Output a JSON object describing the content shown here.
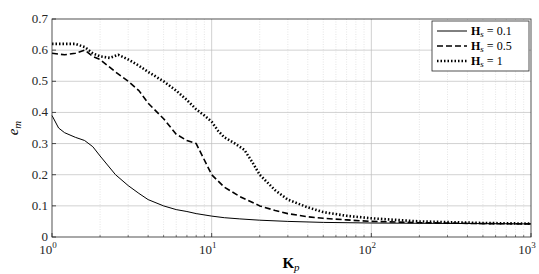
{
  "chart_data": {
    "type": "line",
    "title": "",
    "xlabel": "K_p",
    "ylabel": "e_m",
    "xscale": "log",
    "xlim": [
      1,
      1000
    ],
    "ylim": [
      0,
      0.7
    ],
    "grid": true,
    "legend_position": "upper right",
    "x_ticks": [
      "10^0",
      "10^1",
      "10^2",
      "10^3"
    ],
    "y_ticks": [
      "0",
      "0.1",
      "0.2",
      "0.3",
      "0.4",
      "0.5",
      "0.6",
      "0.7"
    ],
    "series": [
      {
        "name": "H_s = 0.1",
        "style": "solid",
        "x": [
          1,
          1.1,
          1.2,
          1.4,
          1.6,
          1.8,
          2,
          2.5,
          3,
          3.5,
          4,
          5,
          6,
          7,
          8,
          10,
          12,
          15,
          20,
          30,
          50,
          100,
          200,
          500,
          1000
        ],
        "y": [
          0.39,
          0.35,
          0.335,
          0.32,
          0.31,
          0.29,
          0.26,
          0.2,
          0.165,
          0.14,
          0.12,
          0.1,
          0.088,
          0.082,
          0.075,
          0.067,
          0.062,
          0.058,
          0.054,
          0.05,
          0.047,
          0.045,
          0.044,
          0.043,
          0.042
        ]
      },
      {
        "name": "H_s = 0.5",
        "style": "dashed",
        "x": [
          1,
          1.2,
          1.4,
          1.6,
          1.8,
          2,
          2.5,
          3,
          3.5,
          4,
          5,
          6,
          7,
          8,
          10,
          12,
          15,
          20,
          25,
          30,
          40,
          50,
          70,
          100,
          200,
          500,
          1000
        ],
        "y": [
          0.59,
          0.585,
          0.59,
          0.6,
          0.58,
          0.57,
          0.53,
          0.5,
          0.47,
          0.43,
          0.38,
          0.33,
          0.31,
          0.3,
          0.2,
          0.16,
          0.13,
          0.1,
          0.085,
          0.075,
          0.065,
          0.06,
          0.055,
          0.05,
          0.046,
          0.043,
          0.042
        ]
      },
      {
        "name": "H_s = 1",
        "style": "dotted",
        "x": [
          1,
          1.2,
          1.4,
          1.6,
          1.8,
          2,
          2.3,
          2.6,
          3,
          3.5,
          4,
          5,
          6,
          7,
          8,
          9,
          10,
          11,
          12,
          14,
          16,
          18,
          20,
          25,
          30,
          40,
          50,
          70,
          100,
          200,
          500,
          1000
        ],
        "y": [
          0.62,
          0.62,
          0.62,
          0.61,
          0.59,
          0.58,
          0.575,
          0.585,
          0.57,
          0.55,
          0.53,
          0.5,
          0.47,
          0.44,
          0.41,
          0.39,
          0.37,
          0.34,
          0.32,
          0.3,
          0.28,
          0.24,
          0.2,
          0.15,
          0.12,
          0.095,
          0.08,
          0.068,
          0.06,
          0.05,
          0.045,
          0.043
        ]
      }
    ]
  },
  "legend": {
    "items": [
      {
        "label_bold": "H",
        "label_sub": "s",
        "label_rest": " = 0.1"
      },
      {
        "label_bold": "H",
        "label_sub": "s",
        "label_rest": " = 0.5"
      },
      {
        "label_bold": "H",
        "label_sub": "s",
        "label_rest": " = 1"
      }
    ]
  },
  "axes": {
    "xlabel_main": "K",
    "xlabel_sub": "p",
    "ylabel_main": "e",
    "ylabel_sub": "m"
  }
}
